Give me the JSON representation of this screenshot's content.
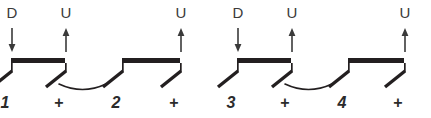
{
  "figure": {
    "kind": "strumming-pattern-notation",
    "background_color": "#ffffff",
    "ink_color": "#231f20",
    "label_color": "#3a3a3a",
    "width": 431,
    "height": 118
  },
  "positions": [
    {
      "index": 0,
      "x": 11,
      "count": "1",
      "count_type": "number",
      "stroke": "D",
      "stroke_name": "down",
      "arrow": "down-arrow",
      "has_label": true
    },
    {
      "index": 1,
      "x": 65,
      "count": "+",
      "count_type": "and",
      "stroke": "U",
      "stroke_name": "up",
      "arrow": "up-arrow",
      "has_label": true
    },
    {
      "index": 2,
      "x": 122,
      "count": "2",
      "count_type": "number",
      "stroke": "",
      "stroke_name": "none",
      "arrow": "",
      "has_label": false
    },
    {
      "index": 3,
      "x": 180,
      "count": "+",
      "count_type": "and",
      "stroke": "U",
      "stroke_name": "up",
      "arrow": "up-arrow",
      "has_label": true
    },
    {
      "index": 4,
      "x": 237,
      "count": "3",
      "count_type": "number",
      "stroke": "D",
      "stroke_name": "down",
      "arrow": "down-arrow",
      "has_label": true
    },
    {
      "index": 5,
      "x": 291,
      "count": "+",
      "count_type": "and",
      "stroke": "U",
      "stroke_name": "up",
      "arrow": "up-arrow",
      "has_label": true
    },
    {
      "index": 6,
      "x": 348,
      "count": "4",
      "count_type": "number",
      "stroke": "",
      "stroke_name": "none",
      "arrow": "",
      "has_label": false
    },
    {
      "index": 7,
      "x": 404,
      "count": "+",
      "count_type": "and",
      "stroke": "U",
      "stroke_name": "up",
      "arrow": "up-arrow",
      "has_label": true
    }
  ],
  "beams": [
    {
      "index": 0,
      "from_position": 0,
      "to_position": 1
    },
    {
      "index": 1,
      "from_position": 2,
      "to_position": 3
    },
    {
      "index": 2,
      "from_position": 4,
      "to_position": 5
    },
    {
      "index": 3,
      "from_position": 6,
      "to_position": 7
    }
  ],
  "ties": [
    {
      "index": 0,
      "from_position": 1,
      "to_position": 2
    },
    {
      "index": 1,
      "from_position": 5,
      "to_position": 6
    }
  ],
  "geometry": {
    "label_text_y": 18,
    "arrow_top_y": 28,
    "arrow_bottom_y": 52,
    "beam_y": 58,
    "beam_thickness": 5,
    "stem_bottom_y": 72,
    "slash_dx": -20,
    "slash_dy": 16,
    "tie_y": 84,
    "tie_depth": 11,
    "count_text_y": 108
  },
  "counts_sequence": "1 + 2 + 3 + 4 +"
}
